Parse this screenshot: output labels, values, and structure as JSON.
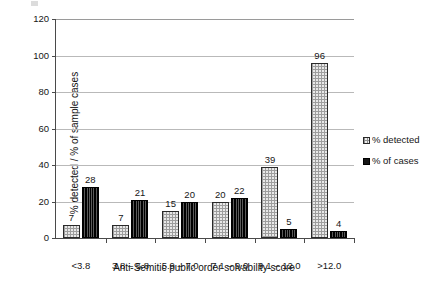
{
  "chart_data": {
    "type": "bar",
    "title": "",
    "xlabel": "Anti-Semitic public order solvability score",
    "ylabel": "% detected / % of sample cases",
    "ylim": [
      0,
      120
    ],
    "yticks": [
      0,
      20,
      40,
      60,
      80,
      100,
      120
    ],
    "ytick_labels": [
      "0",
      "20",
      "40",
      "60",
      "80",
      "100",
      "120"
    ],
    "grid": "horizontal",
    "legend_position": "right",
    "categories": [
      "<3.8",
      "3.8 – 5.8",
      "5.9 – 7.0",
      "7.1 – 9.0",
      "9.1 – 12.0",
      ">12.0"
    ],
    "series": [
      {
        "name": "% detected",
        "pattern": "light-dotted",
        "color": "#e8e8e8",
        "values": [
          7,
          7,
          15,
          20,
          39,
          96
        ],
        "labels": [
          "7",
          "7",
          "15",
          "20",
          "39",
          "96"
        ]
      },
      {
        "name": "% of cases",
        "pattern": "dark-vertical-hatch",
        "color": "#121212",
        "values": [
          28,
          21,
          20,
          22,
          5,
          4
        ],
        "labels": [
          "28",
          "21",
          "20",
          "22",
          "5",
          "4"
        ]
      }
    ]
  }
}
